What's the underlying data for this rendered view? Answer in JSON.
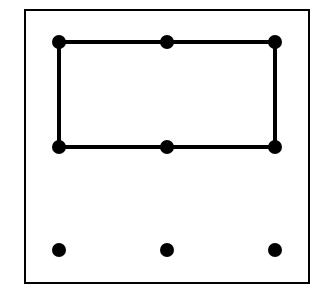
{
  "diagram": {
    "colors": {
      "background": "#ffffff",
      "ink": "#000000"
    },
    "frame": {
      "x": 25,
      "y": 10,
      "width": 284,
      "height": 273
    },
    "columns_x": [
      59,
      167,
      275
    ],
    "rows_y": [
      42,
      147,
      250
    ],
    "dots": [
      {
        "col": 0,
        "row": 0,
        "x": 59,
        "y": 42
      },
      {
        "col": 1,
        "row": 0,
        "x": 167,
        "y": 42
      },
      {
        "col": 2,
        "row": 0,
        "x": 275,
        "y": 42
      },
      {
        "col": 0,
        "row": 1,
        "x": 59,
        "y": 147
      },
      {
        "col": 1,
        "row": 1,
        "x": 167,
        "y": 147
      },
      {
        "col": 2,
        "row": 1,
        "x": 275,
        "y": 147
      },
      {
        "col": 0,
        "row": 2,
        "x": 59,
        "y": 250
      },
      {
        "col": 1,
        "row": 2,
        "x": 167,
        "y": 250
      },
      {
        "col": 2,
        "row": 2,
        "x": 275,
        "y": 250
      }
    ],
    "connected_rectangle": {
      "x1": 59,
      "y1": 42,
      "x2": 275,
      "y2": 147
    }
  }
}
